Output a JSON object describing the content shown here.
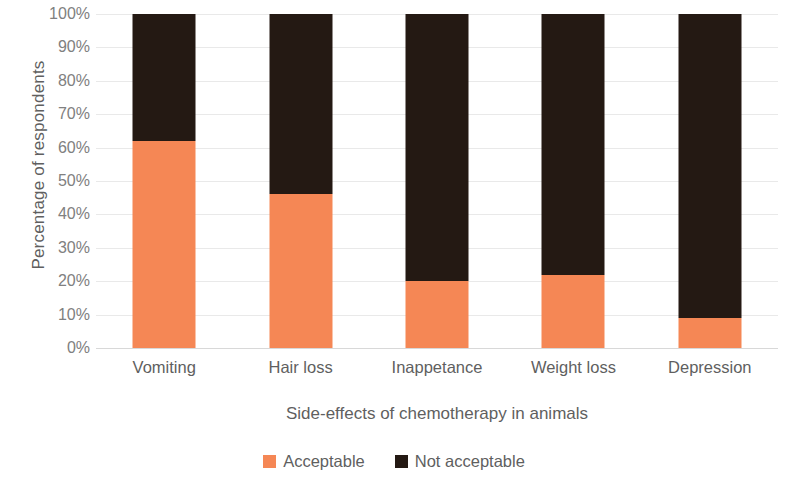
{
  "chart_data": {
    "type": "bar",
    "subtype": "stacked-100-percent",
    "title": "",
    "xlabel": "Side-effects of chemotherapy in animals",
    "ylabel": "Percentage of respondents",
    "categories": [
      "Vomiting",
      "Hair loss",
      "Inappetance",
      "Weight loss",
      "Depression"
    ],
    "series": [
      {
        "name": "Acceptable",
        "color": "#F58755",
        "values": [
          62,
          46,
          20,
          22,
          9
        ]
      },
      {
        "name": "Not acceptable",
        "color": "#241913",
        "values": [
          38,
          54,
          80,
          78,
          91
        ]
      }
    ],
    "ylim": [
      0,
      100
    ],
    "y_tick_labels": [
      "100%",
      "90%",
      "80%",
      "70%",
      "60%",
      "50%",
      "40%",
      "30%",
      "20%",
      "10%",
      "0%"
    ],
    "y_tick_values": [
      100,
      90,
      80,
      70,
      60,
      50,
      40,
      30,
      20,
      10,
      0
    ],
    "grid": true,
    "grid_axis": "y",
    "legend_position": "bottom",
    "value_unit": "%"
  },
  "legend": {
    "items": [
      {
        "label": "Acceptable",
        "color": "#F58755"
      },
      {
        "label": "Not acceptable",
        "color": "#241913"
      }
    ]
  }
}
